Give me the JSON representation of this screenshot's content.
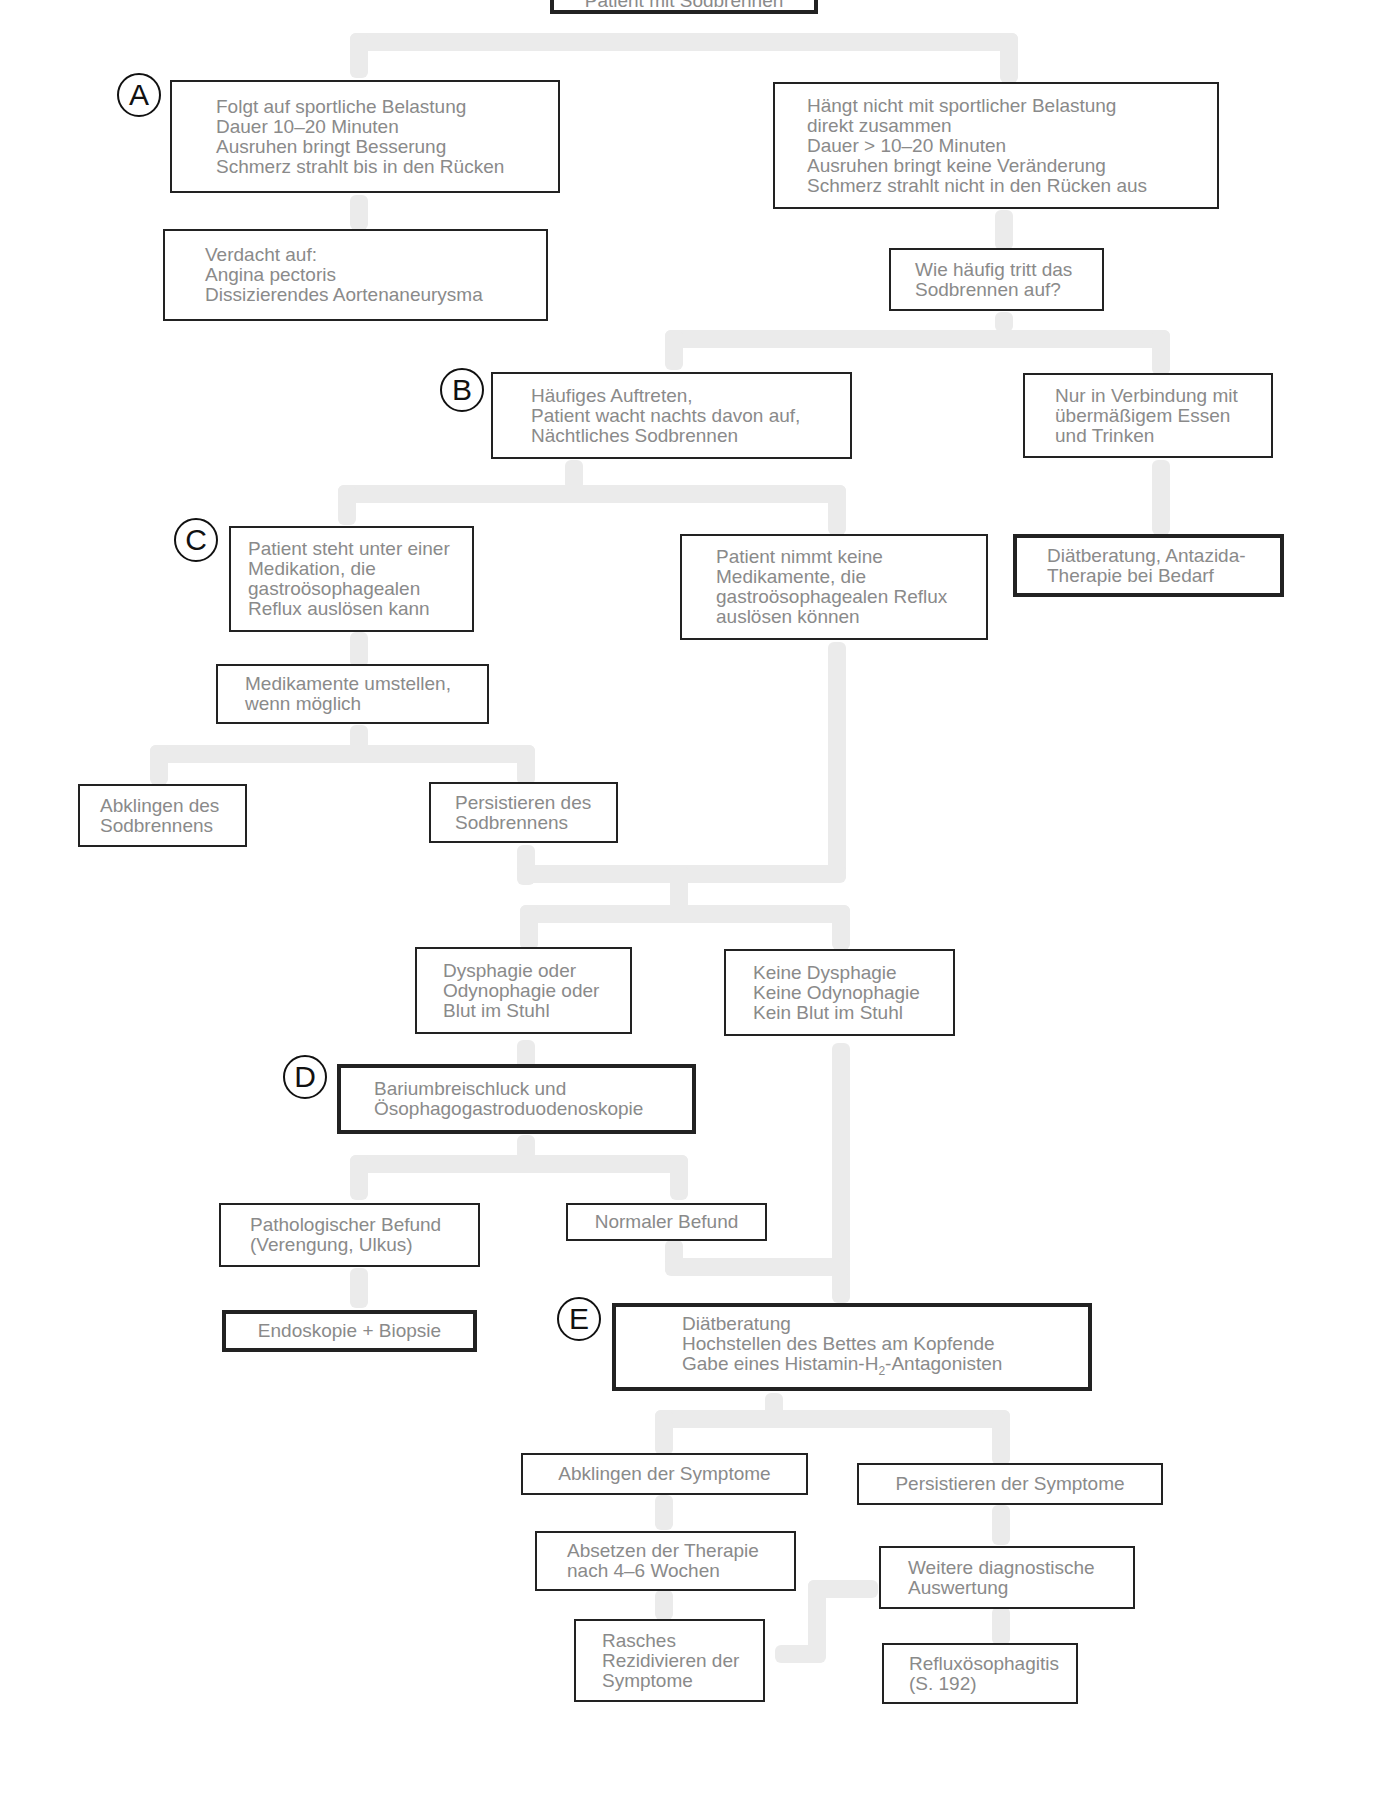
{
  "title": "Patient mit Sodbrennen",
  "labels": {
    "a": "A",
    "b": "B",
    "c": "C",
    "d": "D",
    "e": "E"
  },
  "nodes": {
    "start": "Patient mit Sodbrennen",
    "a_exercise": "Folgt auf sportliche Belastung\nDauer 10–20 Minuten\nAusruhen bringt Besserung\nSchmerz strahlt bis in den Rücken",
    "a_not_exercise": "Hängt nicht mit sportlicher Belastung\ndirekt zusammen\nDauer > 10–20 Minuten\nAusruhen bringt keine Veränderung\nSchmerz strahlt nicht in den Rücken aus",
    "suspect": "Verdacht auf:\n  Angina pectoris\n  Dissizierendes Aortenaneurysma",
    "frequency_question": "Wie häufig tritt das\nSodbrennen auf?",
    "b_frequent": "Häufiges Auftreten,\nPatient wacht nachts davon auf,\nNächtliches Sodbrennen",
    "only_overeating": "Nur in Verbindung mit\nübermäßigem Essen\nund Trinken",
    "diet_antacid": "Diätberatung, Antazida-\nTherapie bei Bedarf",
    "c_medication": "Patient steht unter einer\nMedikation, die\ngastroösophagealen\nReflux auslösen kann",
    "no_medication": "Patient nimmt keine\nMedikamente, die\ngastroösophagealen Reflux\nauslösen können",
    "change_medication": "Medikamente umstellen,\nwenn möglich",
    "heartburn_resolves": "Abklingen des\nSodbrennens",
    "heartburn_persists": "Persistieren des\nSodbrennens",
    "dysphagia": "Dysphagie oder\nOdynophagie oder\nBlut im Stuhl",
    "no_dysphagia": "Keine Dysphagie\nKeine Odynophagie\nKein Blut im Stuhl",
    "d_barium": "Bariumbreischluck und\nÖsophagogastroduodenoskopie",
    "pathological": "Pathologischer Befund\n(Verengung, Ulkus)",
    "normal": "Normaler Befund",
    "endoscopy": "Endoskopie + Biopsie",
    "e_line1": "Diätberatung",
    "e_line2": "Hochstellen des Bettes am Kopfende",
    "e_line3_pre": "Gabe eines Histamin-H",
    "e_line3_sub": "2",
    "e_line3_post": "-Antagonisten",
    "symptoms_resolve": "Abklingen der Symptome",
    "symptoms_persist": "Persistieren der Symptome",
    "stop_therapy": "Absetzen der Therapie\nnach 4–6 Wochen",
    "further_diagnostics": "Weitere diagnostische\nAuswertung",
    "rapid_relapse": "Rasches\nRezidivieren der\nSymptome",
    "reflux_esophagitis": "Refluxösophagitis\n(S. 192)"
  },
  "colors": {
    "connector": "#ebebeb",
    "border": "#222222",
    "text": "#8a8a8a"
  }
}
